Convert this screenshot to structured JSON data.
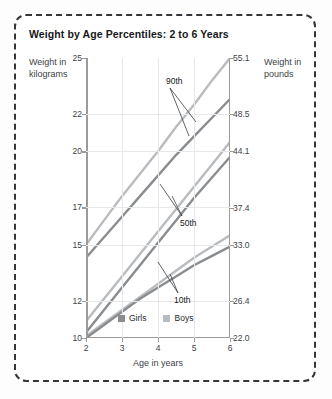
{
  "chart_data": {
    "type": "line",
    "title": "Weight by Age Percentiles: 2 to 6 Years",
    "xlabel": "Age in years",
    "ylabel": "Weight in kilograms",
    "ylabel_right": "Weight in pounds",
    "xlim": [
      2,
      6
    ],
    "ylim": [
      10,
      25
    ],
    "grid": true,
    "x_ticks": [
      "2",
      "3",
      "4",
      "5",
      "6"
    ],
    "y_ticks_left": [
      "25",
      "22",
      "20",
      "17",
      "15",
      "12",
      "10"
    ],
    "y_ticks_left_values": [
      25,
      22,
      20,
      17,
      15,
      12,
      10
    ],
    "y_ticks_right": [
      "55.1",
      "48.5",
      "44.1",
      "37.4",
      "33.0",
      "26.4",
      "22.0"
    ],
    "y_ticks_right_values": [
      55.1,
      48.5,
      44.1,
      37.4,
      33.0,
      26.4,
      22.0
    ],
    "legend": [
      "Girls",
      "Boys"
    ],
    "legend_position": "bottom-center-inside",
    "annotations": [
      "90th",
      "50th",
      "10th"
    ],
    "x": [
      2,
      2.5,
      3,
      3.5,
      4,
      4.5,
      5,
      5.5,
      6
    ],
    "series": [
      {
        "name": "Boys 90th",
        "percentile": "90th",
        "sex": "Boys",
        "values": [
          15.0,
          16.3,
          17.6,
          18.8,
          20.0,
          21.3,
          22.5,
          23.8,
          25.0
        ]
      },
      {
        "name": "Girls 90th",
        "percentile": "90th",
        "sex": "Girls",
        "values": [
          14.3,
          15.4,
          16.5,
          17.6,
          18.7,
          19.8,
          20.8,
          21.8,
          22.8
        ]
      },
      {
        "name": "Boys 50th",
        "percentile": "50th",
        "sex": "Boys",
        "values": [
          10.9,
          12.1,
          13.3,
          14.5,
          15.7,
          16.9,
          18.1,
          19.3,
          20.5
        ]
      },
      {
        "name": "Girls 50th",
        "percentile": "50th",
        "sex": "Girls",
        "values": [
          10.3,
          11.5,
          12.7,
          13.9,
          15.1,
          16.3,
          17.5,
          18.6,
          19.7
        ]
      },
      {
        "name": "Boys 10th",
        "percentile": "10th",
        "sex": "Boys",
        "values": [
          10.1,
          10.8,
          11.5,
          12.2,
          12.9,
          13.6,
          14.3,
          14.9,
          15.5
        ]
      },
      {
        "name": "Girls 10th",
        "percentile": "10th",
        "sex": "Girls",
        "values": [
          10.0,
          10.7,
          11.4,
          12.1,
          12.7,
          13.3,
          13.9,
          14.4,
          14.9
        ]
      }
    ],
    "colors": {
      "girls": "#8a8d90",
      "boys": "#b9bcbf",
      "grid": "#e6e8ea",
      "axis": "#9b9b9b",
      "text": "#3d4246"
    }
  },
  "captions": {
    "left": "Weight in kilograms",
    "right": "Weight in pounds"
  }
}
